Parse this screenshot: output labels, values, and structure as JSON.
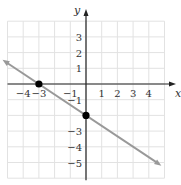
{
  "chart_data": {
    "type": "line",
    "title": "",
    "xlabel": "x",
    "ylabel": "y",
    "xlim": [
      -5,
      5
    ],
    "ylim": [
      -6,
      4
    ],
    "grid": true,
    "x_ticks": [
      "−4",
      "−3",
      "−1",
      "1",
      "2",
      "3",
      "4"
    ],
    "y_ticks": [
      "3",
      "2",
      "1",
      "−1",
      "−3",
      "−4",
      "−5"
    ],
    "x_tick_values": [
      -4,
      -3,
      -1,
      1,
      2,
      3,
      4
    ],
    "y_tick_values": [
      3,
      2,
      1,
      -1,
      -3,
      -4,
      -5
    ],
    "series": [
      {
        "name": "line",
        "equation": "y = -2/3 x - 2",
        "x": [
          -5.0,
          4.8
        ],
        "y": [
          1.33,
          -5.2
        ],
        "color": "#999999",
        "arrows": "both"
      }
    ],
    "points": [
      {
        "label": "x-intercept",
        "x": -3,
        "y": 0
      },
      {
        "label": "y-intercept",
        "x": 0,
        "y": -2
      }
    ]
  }
}
